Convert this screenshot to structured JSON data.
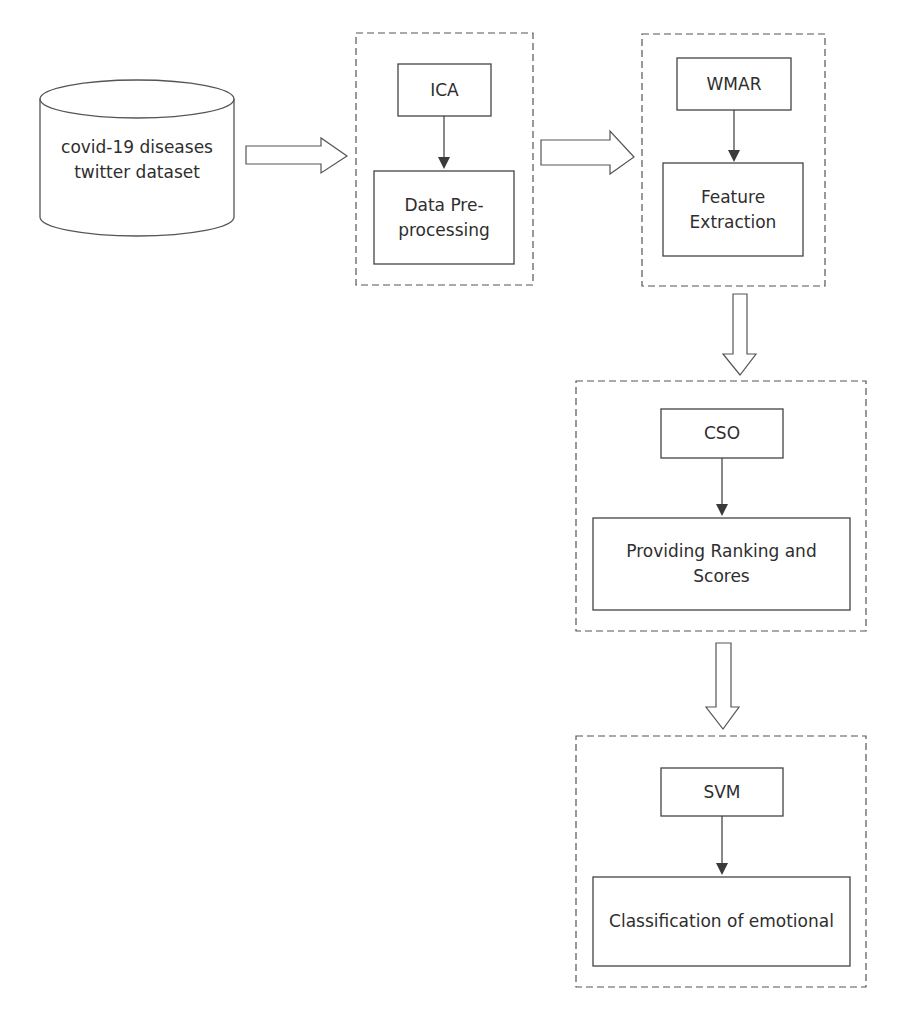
{
  "diagram": {
    "dataset": {
      "label_line1": "covid-19 diseases",
      "label_line2": "twitter dataset"
    },
    "stages": [
      {
        "method": "ICA",
        "step": "Data Pre-processing",
        "step_line1": "Data Pre-",
        "step_line2": "processing"
      },
      {
        "method": "WMAR",
        "step": "Feature Extraction",
        "step_line1": "Feature",
        "step_line2": "Extraction"
      },
      {
        "method": "CSO",
        "step": "Providing Ranking and Scores",
        "step_line1": "Providing Ranking and",
        "step_line2": "Scores"
      },
      {
        "method": "SVM",
        "step": "Classification of emotional",
        "step_line1": "Classification of emotional",
        "step_line2": ""
      }
    ],
    "colors": {
      "stroke": "#4a4a4a",
      "text": "#2e2e2e",
      "background": "#ffffff"
    }
  }
}
